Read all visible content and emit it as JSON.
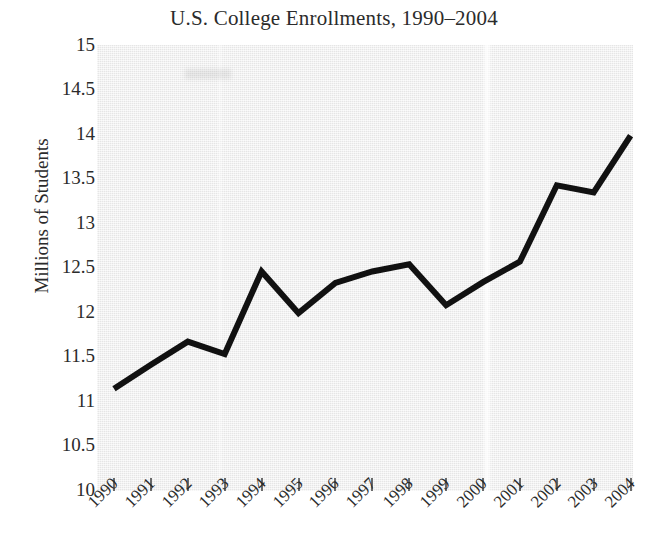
{
  "chart_data": {
    "type": "line",
    "title": "U.S. College Enrollments, 1990–2004",
    "xlabel": "",
    "ylabel": "Millions of Students",
    "categories": [
      "1990",
      "1991",
      "1992",
      "1993",
      "1994",
      "1995",
      "1996",
      "1997",
      "1998",
      "1999",
      "2000",
      "2001",
      "2002",
      "2003",
      "2004"
    ],
    "values": [
      11.13,
      11.4,
      11.66,
      11.52,
      12.45,
      11.98,
      12.32,
      12.45,
      12.53,
      12.07,
      12.33,
      12.56,
      13.42,
      13.34,
      13.98
    ],
    "series": [
      {
        "name": "Enrollment",
        "values": [
          11.13,
          11.4,
          11.66,
          11.52,
          12.45,
          11.98,
          12.32,
          12.45,
          12.53,
          12.07,
          12.33,
          12.56,
          13.42,
          13.34,
          13.98
        ]
      }
    ],
    "ylim": [
      10,
      15
    ],
    "ytick_labels": [
      "15",
      "14.5",
      "14",
      "13.5",
      "13",
      "12.5",
      "12",
      "11.5",
      "11",
      "10.5",
      "10"
    ],
    "ytick_values": [
      15,
      14.5,
      14,
      13.5,
      13,
      12.5,
      12,
      11.5,
      11,
      10.5,
      10
    ],
    "xtick_labels": [
      "1990",
      "1991",
      "1992",
      "1993",
      "1994",
      "1995",
      "1996",
      "1997",
      "1998",
      "1999",
      "2000",
      "2001",
      "2002",
      "2003",
      "2004"
    ],
    "grid": false,
    "legend": null,
    "legend_position": "none",
    "line_color": "#111111",
    "line_width": 6,
    "plot_background": "#efefef",
    "figure_background": "#ffffff",
    "text_color": "#2b2b2b",
    "annotations": []
  }
}
